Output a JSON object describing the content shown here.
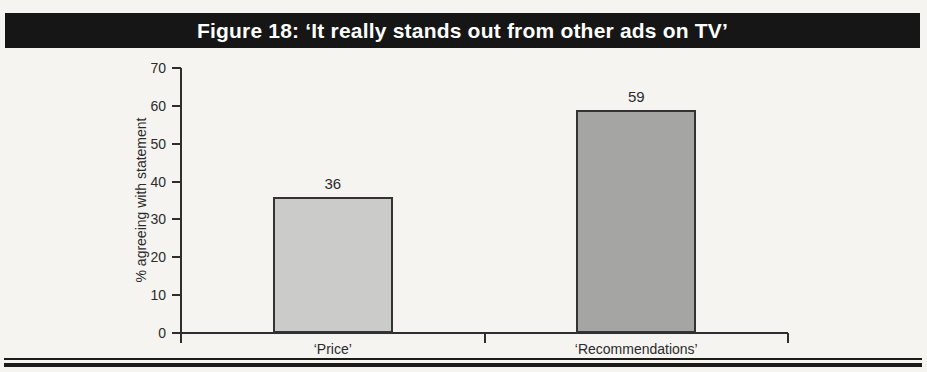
{
  "title": "Figure 18: ‘It really stands out from other ads on TV’",
  "colors": {
    "title_bar_bg": "#161616",
    "title_text": "#ffffff",
    "axis": "#2e2e2e",
    "bar_border": "#333333",
    "page_bg": "#f5f4f1"
  },
  "chart_data": {
    "type": "bar",
    "title": "Figure 18: ‘It really stands out from other ads on TV’",
    "categories": [
      "‘Price’",
      "‘Recommendations’"
    ],
    "values": [
      36,
      59
    ],
    "data_labels": [
      "36",
      "59"
    ],
    "bar_colors": [
      "#cbcbca",
      "#a5a5a4"
    ],
    "xlabel": "",
    "ylabel": "% agreeing with statement",
    "ylim": [
      0,
      70
    ],
    "yticks": [
      0,
      10,
      20,
      30,
      40,
      50,
      60,
      70
    ],
    "grid": false,
    "legend": null
  }
}
